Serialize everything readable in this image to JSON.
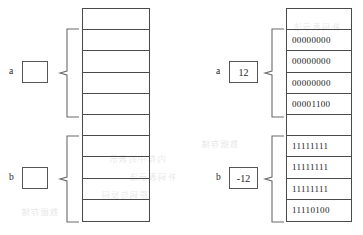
{
  "diagram": {
    "title_alt": "Memory representation of integers a and b",
    "left_panel": {
      "cells_count": 10,
      "cells": [
        "",
        "",
        "",
        "",
        "",
        "",
        "",
        "",
        "",
        ""
      ],
      "groups": [
        {
          "label": "a",
          "value": "",
          "rows": [
            1,
            2,
            3,
            4
          ]
        },
        {
          "label": "b",
          "value": "",
          "rows": [
            6,
            7,
            8,
            9
          ]
        }
      ]
    },
    "right_panel": {
      "cells_count": 10,
      "cells": [
        "",
        "00000000",
        "00000000",
        "00000000",
        "00001100",
        "",
        "11111111",
        "11111111",
        "11111111",
        "11110100"
      ],
      "groups": [
        {
          "label": "a",
          "value": "12",
          "rows": [
            1,
            2,
            3,
            4
          ]
        },
        {
          "label": "b",
          "value": "-12",
          "rows": [
            6,
            7,
            8,
            9
          ]
        }
      ]
    }
  },
  "labels": {
    "a_left": "a",
    "b_left": "b",
    "a_right": "a",
    "b_right": "b"
  },
  "values": {
    "a_left_box": "",
    "b_left_box": "",
    "a_right_box": "12",
    "b_right_box": "-12"
  },
  "bits": {
    "a_byte_0": "00000000",
    "a_byte_1": "00000000",
    "a_byte_2": "00000000",
    "a_byte_3": "00001100",
    "b_byte_0": "11111111",
    "b_byte_1": "11111111",
    "b_byte_2": "11111111",
    "b_byte_3": "11110100"
  },
  "watermark": {
    "line_1": "内存中的表示",
    "line_2": "补码表示法",
    "line_3": "原码与反码",
    "line_4": "数据存储"
  },
  "colors": {
    "stroke": "#4a4a4a",
    "text": "#1d1d1d",
    "background": "#ffffff",
    "bleed": "#b9b9b9"
  }
}
